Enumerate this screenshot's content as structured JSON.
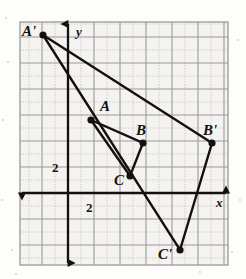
{
  "figure": {
    "kind": "coordinate-grid-diagram",
    "background_color": "#fdfdfc",
    "ink_color": "#14100f",
    "grid_major_color": "#9b9a97",
    "grid_minor_color": "#c3c2bf",
    "grid_fill_color": "#f4f3f1"
  },
  "viewport": {
    "width": 246,
    "height": 279,
    "plot_left": 20,
    "plot_top": 22,
    "plot_right": 228,
    "plot_bottom": 265
  },
  "axes": {
    "origin_px": {
      "x": 68,
      "y": 193
    },
    "unit_px": 13.0,
    "x_axis": {
      "label": "x",
      "label_px": {
        "x": 216,
        "y": 207
      },
      "tick_label": "2",
      "tick_label_px": {
        "x": 86,
        "y": 212
      },
      "left_arrow": true,
      "right_arrow": true,
      "y_px": 193,
      "x_start_px": 22,
      "x_end_px": 226
    },
    "y_axis": {
      "label": "y",
      "label_px": {
        "x": 76,
        "y": 36
      },
      "tick_label": "2",
      "tick_label_px": {
        "x": 52,
        "y": 172
      },
      "up_arrow": true,
      "down_arrow": true,
      "x_px": 68,
      "y_start_px": 24,
      "y_end_px": 263
    }
  },
  "chart_data": {
    "type": "scatter",
    "title": "",
    "xlabel": "x",
    "ylabel": "y",
    "xlim": [
      -3.7,
      12.3
    ],
    "ylim": [
      -5.5,
      13.2
    ],
    "grid": true,
    "grid_major_step": 2,
    "grid_minor_step": 1,
    "points": [
      {
        "name": "A'",
        "x": -2,
        "y": 12,
        "px": 43,
        "py": 35,
        "label_px": {
          "x": 22,
          "y": 36
        }
      },
      {
        "name": "A",
        "x": 1.8,
        "y": 5.6,
        "px": 91,
        "py": 120,
        "label_px": {
          "x": 100,
          "y": 111
        }
      },
      {
        "name": "B",
        "x": 5.8,
        "y": 3.8,
        "px": 143,
        "py": 143,
        "label_px": {
          "x": 136,
          "y": 135
        }
      },
      {
        "name": "B'",
        "x": 11.1,
        "y": 3.8,
        "px": 212,
        "py": 143,
        "label_px": {
          "x": 203,
          "y": 135
        }
      },
      {
        "name": "C",
        "x": 4.8,
        "y": 1.3,
        "px": 130,
        "py": 176,
        "label_px": {
          "x": 114,
          "y": 185
        }
      },
      {
        "name": "C'",
        "x": 8.6,
        "y": -4.4,
        "px": 180,
        "py": 250,
        "label_px": {
          "x": 158,
          "y": 259
        }
      }
    ],
    "polygons": [
      {
        "name": "triangle-ABC",
        "vertices": [
          "A",
          "B",
          "C"
        ],
        "closed": true
      },
      {
        "name": "triangle-A1B1C1",
        "vertices": [
          "A'",
          "B'",
          "C'"
        ],
        "closed": true
      }
    ]
  },
  "labels": {
    "a_prime": "A'",
    "a": "A",
    "b": "B",
    "b_prime": "B'",
    "c": "C",
    "c_prime": "C'",
    "x_axis": "x",
    "y_axis": "y",
    "x_tick": "2",
    "y_tick": "2"
  }
}
